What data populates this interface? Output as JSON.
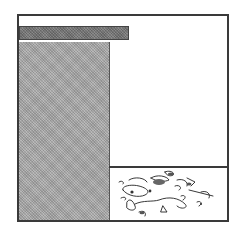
{
  "diagram": {
    "colors": {
      "frame": "#3a3a3a",
      "column_fill": "#a9a9a9",
      "bar_fill": "#7a7a7a",
      "background": "#ffffff"
    },
    "regions": [
      {
        "name": "left-column",
        "fill": "hatched-gray"
      },
      {
        "name": "top-bar",
        "fill": "hatched-dark-gray"
      },
      {
        "name": "upper-right-compartment",
        "fill": "white"
      },
      {
        "name": "lower-right-compartment",
        "fill": "white",
        "content": "debris-sketch"
      }
    ]
  }
}
